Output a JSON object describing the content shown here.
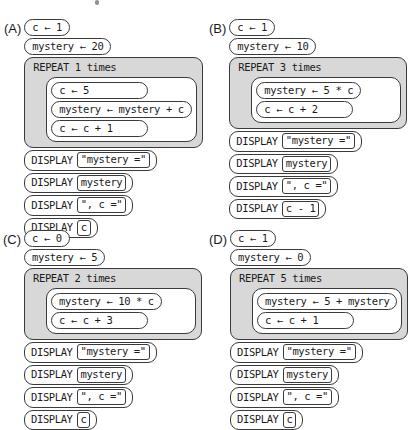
{
  "colors": {
    "background": "#ffffff",
    "repeat_fill": "#d8d8d8",
    "border": "#3a3a3a",
    "text": "#1b1b1b"
  },
  "keywords": {
    "display": "DISPLAY"
  },
  "options": [
    {
      "label": "(A)",
      "assignments": [
        "c ← 1",
        "mystery ← 20"
      ],
      "repeat": {
        "header": "REPEAT 1 times",
        "body": [
          "c ← 5",
          "mystery ← mystery + c",
          "c ← c + 1"
        ]
      },
      "displays": [
        "\"mystery =\"",
        "mystery",
        "\", c =\"",
        "c"
      ]
    },
    {
      "label": "(B)",
      "assignments": [
        "c ← 1",
        "mystery ← 10"
      ],
      "repeat": {
        "header": "REPEAT 3 times",
        "body": [
          "mystery ← 5 * c",
          "c ← c + 2"
        ]
      },
      "displays": [
        "\"mystery =\"",
        "mystery",
        "\", c =\"",
        "c - 1"
      ]
    },
    {
      "label": "(C)",
      "assignments": [
        "c ← 0",
        "mystery ← 5"
      ],
      "repeat": {
        "header": "REPEAT 2 times",
        "body": [
          "mystery ← 10 * c",
          "c ← c + 3"
        ]
      },
      "displays": [
        "\"mystery =\"",
        "mystery",
        "\", c =\"",
        "c"
      ]
    },
    {
      "label": "(D)",
      "assignments": [
        "c ← 1",
        "mystery ← 0"
      ],
      "repeat": {
        "header": "REPEAT 5 times",
        "body": [
          "mystery ← 5 + mystery",
          "c ← c + 1"
        ]
      },
      "displays": [
        "\"mystery =\"",
        "mystery",
        "\", c =\"",
        "c"
      ]
    }
  ]
}
